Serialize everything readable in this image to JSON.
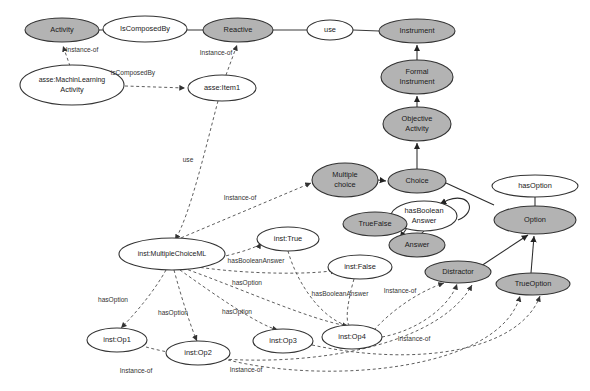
{
  "diagram": {
    "colors": {
      "class_fill": "#b3b3b3",
      "instance_fill": "#ffffff",
      "stroke": "#333333",
      "edge": "#2b2b2b",
      "dashed_edge": "#555555"
    },
    "nodes": [
      {
        "id": "activity",
        "label": "Activity",
        "label2": "",
        "kind": "class",
        "fill": "#b3b3b3",
        "cx": 62,
        "cy": 30,
        "rx": 37,
        "ry": 12
      },
      {
        "id": "iscomposedby",
        "label": "IsComposedBy",
        "label2": "",
        "kind": "relation",
        "fill": "#ffffff",
        "cx": 145,
        "cy": 29,
        "rx": 42,
        "ry": 13
      },
      {
        "id": "reactive",
        "label": "Reactive",
        "label2": "",
        "kind": "class",
        "fill": "#b3b3b3",
        "cx": 238,
        "cy": 30,
        "rx": 35,
        "ry": 12
      },
      {
        "id": "use",
        "label": "use",
        "label2": "",
        "kind": "relation",
        "fill": "#ffffff",
        "cx": 330,
        "cy": 30,
        "rx": 23,
        "ry": 10
      },
      {
        "id": "instrument",
        "label": "Instrument",
        "label2": "",
        "kind": "class",
        "fill": "#b3b3b3",
        "cx": 417,
        "cy": 31,
        "rx": 38,
        "ry": 12
      },
      {
        "id": "formalinstrument",
        "label": "Formal",
        "label2": "Instrument",
        "kind": "class",
        "fill": "#b3b3b3",
        "cx": 417,
        "cy": 77,
        "rx": 36,
        "ry": 17
      },
      {
        "id": "objectiveactivity",
        "label": "Objective",
        "label2": "Activity",
        "kind": "class",
        "fill": "#b3b3b3",
        "cx": 417,
        "cy": 124,
        "rx": 34,
        "ry": 17
      },
      {
        "id": "mlactivity",
        "label": "asse:MachinLearning",
        "label2": "Activity",
        "kind": "instance",
        "fill": "#ffffff",
        "cx": 72,
        "cy": 85,
        "rx": 52,
        "ry": 20
      },
      {
        "id": "item1",
        "label": "asse:Item1",
        "label2": "",
        "kind": "instance",
        "fill": "#ffffff",
        "cx": 222,
        "cy": 88,
        "rx": 34,
        "ry": 13
      },
      {
        "id": "multiplechoice",
        "label": "Multiple",
        "label2": "choice",
        "kind": "class",
        "fill": "#b3b3b3",
        "cx": 345,
        "cy": 180,
        "rx": 33,
        "ry": 17
      },
      {
        "id": "choice",
        "label": "Choice",
        "label2": "",
        "kind": "class",
        "fill": "#b3b3b3",
        "cx": 417,
        "cy": 181,
        "rx": 29,
        "ry": 12
      },
      {
        "id": "hasoption",
        "label": "hasOption",
        "label2": "",
        "kind": "relation",
        "fill": "#ffffff",
        "cx": 535,
        "cy": 186,
        "rx": 43,
        "ry": 11
      },
      {
        "id": "option",
        "label": "Option",
        "label2": "",
        "kind": "class",
        "fill": "#b3b3b3",
        "cx": 535,
        "cy": 220,
        "rx": 41,
        "ry": 14
      },
      {
        "id": "hasbooleananswer",
        "label": "hasBoolean",
        "label2": "Answer",
        "kind": "relation",
        "fill": "#ffffff",
        "cx": 424,
        "cy": 216,
        "rx": 33,
        "ry": 15
      },
      {
        "id": "truefalse",
        "label": "TrueFalse",
        "label2": "",
        "kind": "class",
        "fill": "#b3b3b3",
        "cx": 375,
        "cy": 224,
        "rx": 32,
        "ry": 12
      },
      {
        "id": "answer",
        "label": "Answer",
        "label2": "",
        "kind": "class",
        "fill": "#b3b3b3",
        "cx": 417,
        "cy": 245,
        "rx": 28,
        "ry": 12
      },
      {
        "id": "distractor",
        "label": "Distractor",
        "label2": "",
        "kind": "class",
        "fill": "#b3b3b3",
        "cx": 458,
        "cy": 272,
        "rx": 33,
        "ry": 11
      },
      {
        "id": "trueoption",
        "label": "TrueOption",
        "label2": "",
        "kind": "class",
        "fill": "#b3b3b3",
        "cx": 533,
        "cy": 284,
        "rx": 37,
        "ry": 11
      },
      {
        "id": "mcml",
        "label": "inst:MultipleChoiceML",
        "label2": "",
        "kind": "instance",
        "fill": "#ffffff",
        "cx": 172,
        "cy": 254,
        "rx": 53,
        "ry": 16
      },
      {
        "id": "insttrue",
        "label": "inst:True",
        "label2": "",
        "kind": "instance",
        "fill": "#ffffff",
        "cx": 288,
        "cy": 239,
        "rx": 31,
        "ry": 12
      },
      {
        "id": "instfalse",
        "label": "inst:False",
        "label2": "",
        "kind": "instance",
        "fill": "#ffffff",
        "cx": 360,
        "cy": 267,
        "rx": 32,
        "ry": 12
      },
      {
        "id": "op1",
        "label": "inst:Op1",
        "label2": "",
        "kind": "instance",
        "fill": "#ffffff",
        "cx": 117,
        "cy": 340,
        "rx": 30,
        "ry": 12
      },
      {
        "id": "op2",
        "label": "inst:Op2",
        "label2": "",
        "kind": "instance",
        "fill": "#ffffff",
        "cx": 198,
        "cy": 353,
        "rx": 32,
        "ry": 12
      },
      {
        "id": "op3",
        "label": "inst:Op3",
        "label2": "",
        "kind": "instance",
        "fill": "#ffffff",
        "cx": 283,
        "cy": 341,
        "rx": 30,
        "ry": 12
      },
      {
        "id": "op4",
        "label": "inst:Op4",
        "label2": "",
        "kind": "instance",
        "fill": "#ffffff",
        "cx": 352,
        "cy": 337,
        "rx": 30,
        "ry": 12
      }
    ],
    "edge_labels": [
      {
        "id": "l-instanceof-activity",
        "text": "Instance-of",
        "x": 82,
        "y": 50,
        "rotate": 0
      },
      {
        "id": "l-iscomposedby-inst",
        "text": "isComposedBy",
        "x": 133,
        "y": 73,
        "rotate": 0
      },
      {
        "id": "l-instanceof-reactive",
        "text": "Instance-of",
        "x": 216,
        "y": 53,
        "rotate": 0
      },
      {
        "id": "l-use-inst",
        "text": "use",
        "x": 188,
        "y": 160,
        "rotate": 0
      },
      {
        "id": "l-instanceof-mc",
        "text": "Instance-of",
        "x": 240,
        "y": 198,
        "rotate": 0
      },
      {
        "id": "l-hasbool-true",
        "text": "hasBooleanAnswer",
        "x": 256,
        "y": 261,
        "rotate": 0
      },
      {
        "id": "l-hasoption-a",
        "text": "hasOption",
        "x": 247,
        "y": 283,
        "rotate": 0
      },
      {
        "id": "l-hasoption-b",
        "text": "hasOption",
        "x": 113,
        "y": 300,
        "rotate": 0
      },
      {
        "id": "l-hasoption-c",
        "text": "hasOption",
        "x": 173,
        "y": 313,
        "rotate": 0
      },
      {
        "id": "l-hasoption-d",
        "text": "hasOption",
        "x": 237,
        "y": 312,
        "rotate": 0
      },
      {
        "id": "l-hasbool-false",
        "text": "hasBooleanAnswer",
        "x": 340,
        "y": 294,
        "rotate": 0
      },
      {
        "id": "l-instanceof-op4",
        "text": "Instance-of",
        "x": 400,
        "y": 291,
        "rotate": 0
      },
      {
        "id": "l-instanceof-right",
        "text": "Instance-of",
        "x": 414,
        "y": 339,
        "rotate": 0
      },
      {
        "id": "l-instanceof-bl",
        "text": "Instance-of",
        "x": 136,
        "y": 371,
        "rotate": 0
      },
      {
        "id": "l-instanceof-bm",
        "text": "Instance-of",
        "x": 246,
        "y": 370,
        "rotate": 0
      }
    ],
    "relationships": [
      {
        "from": "Activity",
        "via": "IsComposedBy",
        "to": "Reactive"
      },
      {
        "from": "Reactive",
        "via": "use",
        "to": "Instrument"
      },
      {
        "from": "Formal Instrument",
        "via": "is-a",
        "to": "Instrument"
      },
      {
        "from": "Objective Activity",
        "via": "is-a",
        "to": "Formal Instrument"
      },
      {
        "from": "Choice",
        "via": "is-a",
        "to": "Objective Activity"
      },
      {
        "from": "Multiple choice",
        "via": "is-a",
        "to": "Choice"
      },
      {
        "from": "Choice",
        "via": "hasOption",
        "to": "Option"
      },
      {
        "from": "TrueFalse",
        "via": "is-a",
        "to": "Answer"
      },
      {
        "from": "Answer",
        "via": "hasBooleanAnswer",
        "to": "Option"
      },
      {
        "from": "Distractor",
        "via": "is-a",
        "to": "Option"
      },
      {
        "from": "TrueOption",
        "via": "is-a",
        "to": "Option"
      },
      {
        "from": "asse:MachinLearningActivity",
        "via": "Instance-of",
        "to": "Activity"
      },
      {
        "from": "asse:MachinLearningActivity",
        "via": "isComposedBy",
        "to": "asse:Item1"
      },
      {
        "from": "asse:Item1",
        "via": "Instance-of",
        "to": "Reactive"
      },
      {
        "from": "asse:Item1",
        "via": "use",
        "to": "inst:MultipleChoiceML"
      },
      {
        "from": "inst:MultipleChoiceML",
        "via": "Instance-of",
        "to": "Multiple choice"
      },
      {
        "from": "inst:MultipleChoiceML",
        "via": "hasOption",
        "to": "inst:Op1"
      },
      {
        "from": "inst:MultipleChoiceML",
        "via": "hasOption",
        "to": "inst:Op2"
      },
      {
        "from": "inst:MultipleChoiceML",
        "via": "hasOption",
        "to": "inst:Op3"
      },
      {
        "from": "inst:MultipleChoiceML",
        "via": "hasOption",
        "to": "inst:Op4"
      },
      {
        "from": "inst:MultipleChoiceML",
        "via": "hasBooleanAnswer",
        "to": "inst:True"
      },
      {
        "from": "inst:MultipleChoiceML",
        "via": "hasBooleanAnswer",
        "to": "inst:False"
      },
      {
        "from": "inst:Op4",
        "via": "Instance-of",
        "to": "Distractor"
      },
      {
        "from": "inst:Op1",
        "via": "Instance-of",
        "to": "Distractor"
      },
      {
        "from": "inst:Op2",
        "via": "Instance-of",
        "to": "TrueOption"
      },
      {
        "from": "inst:Op3",
        "via": "Instance-of",
        "to": "TrueOption"
      }
    ]
  }
}
